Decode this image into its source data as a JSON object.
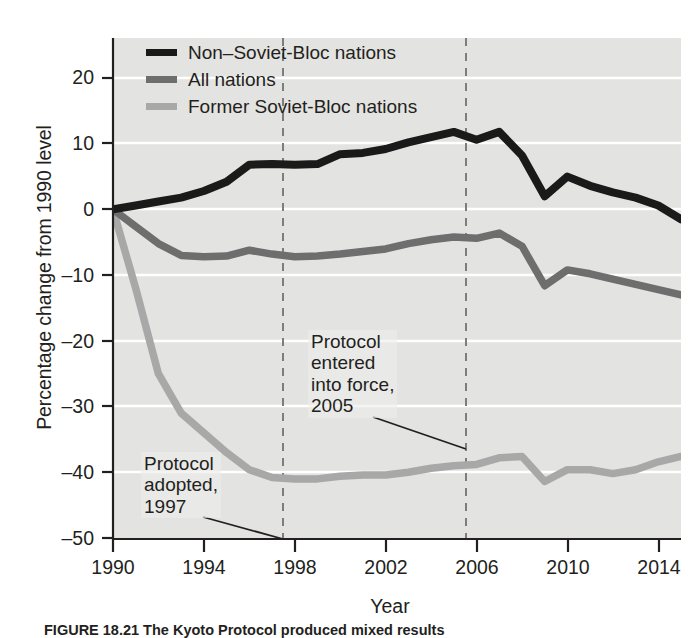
{
  "figure": {
    "caption": "FIGURE 18.21 The Kyoto Protocol produced mixed results",
    "background_plot": "#e3e3e1",
    "background_page": "#ffffff"
  },
  "axes": {
    "ylabel": "Percentage change from 1990 level",
    "xlabel": "Year",
    "yticks": [
      20,
      10,
      0,
      -10,
      -20,
      -30,
      -40,
      -50
    ],
    "ytick_labels": [
      "20",
      "10",
      "0",
      "–10",
      "–20",
      "–30",
      "–40",
      "–50"
    ],
    "xticks": [
      1990,
      1994,
      1998,
      2002,
      2006,
      2010,
      2014
    ],
    "xtick_labels": [
      "1990",
      "1994",
      "1998",
      "2002",
      "2006",
      "2010",
      "2014"
    ],
    "ylim": [
      -50,
      24
    ],
    "xlim": [
      1990,
      2015
    ],
    "grid": "horizontal-white-gridlines"
  },
  "legend": {
    "position": "top-left-inside",
    "entries": [
      {
        "label": "Non–Soviet-Bloc nations",
        "color": "#1a1a1a",
        "swatch": "legend-swatch-black"
      },
      {
        "label": "All nations",
        "color": "#6e6e6e",
        "swatch": "legend-swatch-grey"
      },
      {
        "label": "Former Soviet-Bloc nations",
        "color": "#a8a8a8",
        "swatch": "legend-swatch-light-grey"
      }
    ]
  },
  "annotations": [
    {
      "id": "protocol-adopted",
      "lines": [
        "Protocol",
        "adopted,",
        "1997"
      ],
      "text": "Protocol adopted, 1997",
      "marker_year": 1997.5,
      "marker_style": "dashed-vertical-line"
    },
    {
      "id": "protocol-entered-into-force",
      "lines": [
        "Protocol",
        "entered",
        "into force,",
        "2005"
      ],
      "text": "Protocol entered into force, 2005",
      "marker_year": 2005.5,
      "marker_style": "dashed-vertical-line"
    }
  ],
  "chart_data": {
    "type": "line",
    "title": "",
    "xlabel": "Year",
    "ylabel": "Percentage change from 1990 level",
    "xlim": [
      1990,
      2015
    ],
    "ylim": [
      -50,
      24
    ],
    "grid": true,
    "legend_position": "top-left",
    "x": [
      1990,
      1991,
      1992,
      1993,
      1994,
      1995,
      1996,
      1997,
      1998,
      1999,
      2000,
      2001,
      2002,
      2003,
      2004,
      2005,
      2006,
      2007,
      2008,
      2009,
      2010,
      2011,
      2012,
      2013,
      2014,
      2015
    ],
    "series": [
      {
        "name": "Non–Soviet-Bloc nations",
        "color": "#1a1a1a",
        "values": [
          0,
          0.6,
          1.2,
          1.8,
          2.8,
          4.2,
          6.8,
          6.9,
          6.8,
          6.9,
          8.4,
          8.6,
          9.2,
          10.2,
          11.0,
          11.8,
          10.6,
          11.8,
          8.2,
          2.0,
          5.0,
          3.6,
          2.6,
          1.8,
          0.6,
          -1.5
        ]
      },
      {
        "name": "All nations",
        "color": "#6e6e6e",
        "values": [
          0,
          -2.6,
          -5.2,
          -7.0,
          -7.2,
          -7.1,
          -6.2,
          -6.8,
          -7.2,
          -7.1,
          -6.8,
          -6.4,
          -6.0,
          -5.2,
          -4.6,
          -4.2,
          -4.4,
          -3.6,
          -5.6,
          -11.6,
          -9.2,
          -9.8,
          -10.6,
          -11.4,
          -12.2,
          -13.0
        ]
      },
      {
        "name": "Former Soviet-Bloc nations",
        "color": "#a8a8a8",
        "values": [
          0,
          -12.0,
          -25.0,
          -31.0,
          -34.0,
          -37.0,
          -39.6,
          -40.8,
          -41.0,
          -41.0,
          -40.6,
          -40.4,
          -40.4,
          -40.0,
          -39.4,
          -39.0,
          -38.8,
          -37.8,
          -37.6,
          -41.4,
          -39.6,
          -39.6,
          -40.2,
          -39.6,
          -38.4,
          -37.6
        ]
      }
    ]
  }
}
